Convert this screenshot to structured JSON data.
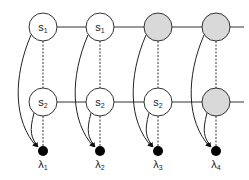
{
  "diagram": {
    "columns": [
      {
        "x": 43,
        "top": {
          "label": "s",
          "sub": "1",
          "shaded": false
        },
        "bottom": {
          "label": "s",
          "sub": "2",
          "shaded": false
        },
        "lambda": {
          "label": "λ",
          "sub": "1"
        }
      },
      {
        "x": 100,
        "top": {
          "label": "s",
          "sub": "1",
          "shaded": false
        },
        "bottom": {
          "label": "s",
          "sub": "2",
          "shaded": false
        },
        "lambda": {
          "label": "λ",
          "sub": "2"
        }
      },
      {
        "x": 158,
        "top": {
          "label": "",
          "sub": "",
          "shaded": true
        },
        "bottom": {
          "label": "s",
          "sub": "2",
          "shaded": false
        },
        "lambda": {
          "label": "λ",
          "sub": "3"
        }
      },
      {
        "x": 216,
        "top": {
          "label": "",
          "sub": "",
          "shaded": true
        },
        "bottom": {
          "label": "",
          "sub": "",
          "shaded": true
        },
        "lambda": {
          "label": "λ",
          "sub": "4"
        }
      }
    ],
    "colors": {
      "shaded": "#d9d9d9",
      "stroke": "#333333",
      "dot": "#000000"
    }
  }
}
